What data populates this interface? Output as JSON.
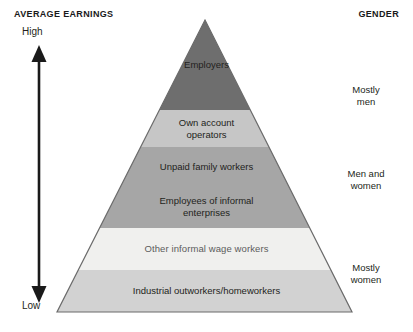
{
  "headers": {
    "left": "AVERAGE EARNINGS",
    "right": "GENDER"
  },
  "axis": {
    "high_label": "High",
    "low_label": "Low",
    "icon": "double-headed-vertical-arrow"
  },
  "pyramid": {
    "apex": {
      "x": 205,
      "y": 20
    },
    "base_left": {
      "x": 57,
      "y": 312
    },
    "base_right": {
      "x": 352,
      "y": 312
    },
    "outline_color": "#6b6b6b",
    "bands": [
      {
        "label": "Employers",
        "color": "#6e6e6e",
        "top": 20,
        "bottom": 110
      },
      {
        "label": "Own account\noperators",
        "color": "#c6c6c6",
        "top": 110,
        "bottom": 147
      },
      {
        "label": "Unpaid family workers",
        "color": "#a6a6a6",
        "top": 147,
        "bottom": 186
      },
      {
        "label": "Employees of informal\nenterprises",
        "color": "#a6a6a6",
        "top": 186,
        "bottom": 228
      },
      {
        "label": "Other informal wage workers",
        "color": "#f0f0ee",
        "top": 228,
        "bottom": 270
      },
      {
        "label": "Industrial outworkers/homeworkers",
        "color": "#d2d2d2",
        "top": 270,
        "bottom": 312
      }
    ]
  },
  "gender_groups": [
    {
      "label": "Mostly\nmen"
    },
    {
      "label": "Men and\nwomen"
    },
    {
      "label": "Mostly\nwomen"
    }
  ]
}
